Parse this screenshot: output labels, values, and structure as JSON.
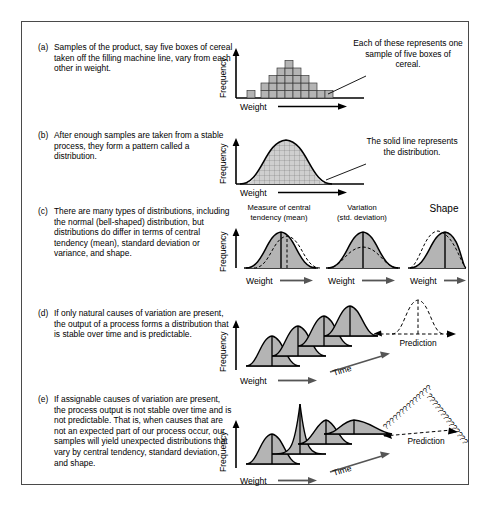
{
  "figure": {
    "panels": [
      {
        "id": "a",
        "label": "(a)",
        "text": "Samples of the product, say five boxes of cereal taken off the filling machine line, vary from each other in weight.",
        "chart": {
          "type": "histogram",
          "ylabel": "Frequency",
          "xlabel": "Weight",
          "bar_counts": [
            1,
            2,
            3,
            4,
            5,
            4,
            3,
            2,
            1
          ],
          "block_note": "each block = one sample of five boxes"
        },
        "annotation": "Each of these represents one sample of five boxes of cereal."
      },
      {
        "id": "b",
        "label": "(b)",
        "text": "After enough samples are taken from a stable process, they form a pattern called a distribution.",
        "chart": {
          "type": "area",
          "ylabel": "Frequency",
          "xlabel": "Weight",
          "curve": "normal bell-shaped, grid-filled"
        },
        "annotation": "The solid line represents the distribution."
      },
      {
        "id": "c",
        "label": "(c)",
        "text": "There are many types of distributions, including the normal (bell-shaped) distribution, but distributions do differ in terms of central tendency (mean), standard deviation or variance, and shape.",
        "chart": {
          "type": "line",
          "ylabel": "Frequency",
          "xlabel": "Weight",
          "subcharts": [
            {
              "title_line1": "Measure of central",
              "title_line2": "tendency (mean)",
              "xlabel": "Weight"
            },
            {
              "title_line1": "Variation",
              "title_line2": "(std. deviation)",
              "xlabel": "Weight"
            },
            {
              "title_line1": "Shape",
              "title_line2": "",
              "xlabel": "Weight"
            }
          ]
        }
      },
      {
        "id": "d",
        "label": "(d)",
        "text": "If only natural causes of variation are present, the output of a process forms a distribution that is stable over time and is predictable.",
        "chart": {
          "type": "area",
          "ylabel": "Frequency",
          "xlabel": "Weight",
          "axis3d": "Time",
          "prediction_label": "Prediction",
          "curve_count": 4,
          "curves_identical": true
        }
      },
      {
        "id": "e",
        "label": "(e)",
        "text": "If assignable causes of variation are present, the process output is not stable over time and is not predictable. That is, when causes that are not an expected part of our process occur, our samples will yield unexpected distributions that vary by central tendency, standard deviation, and shape.",
        "chart": {
          "type": "area",
          "ylabel": "Frequency",
          "xlabel": "Weight",
          "axis3d": "Time",
          "prediction_label": "Prediction",
          "question_marks": "??????????????",
          "curve_count": 4,
          "curves_identical": false
        }
      }
    ]
  },
  "colors": {
    "fill_gray": "#b4b4b4",
    "line_black": "#000000",
    "frame": "#4a4a4a"
  }
}
